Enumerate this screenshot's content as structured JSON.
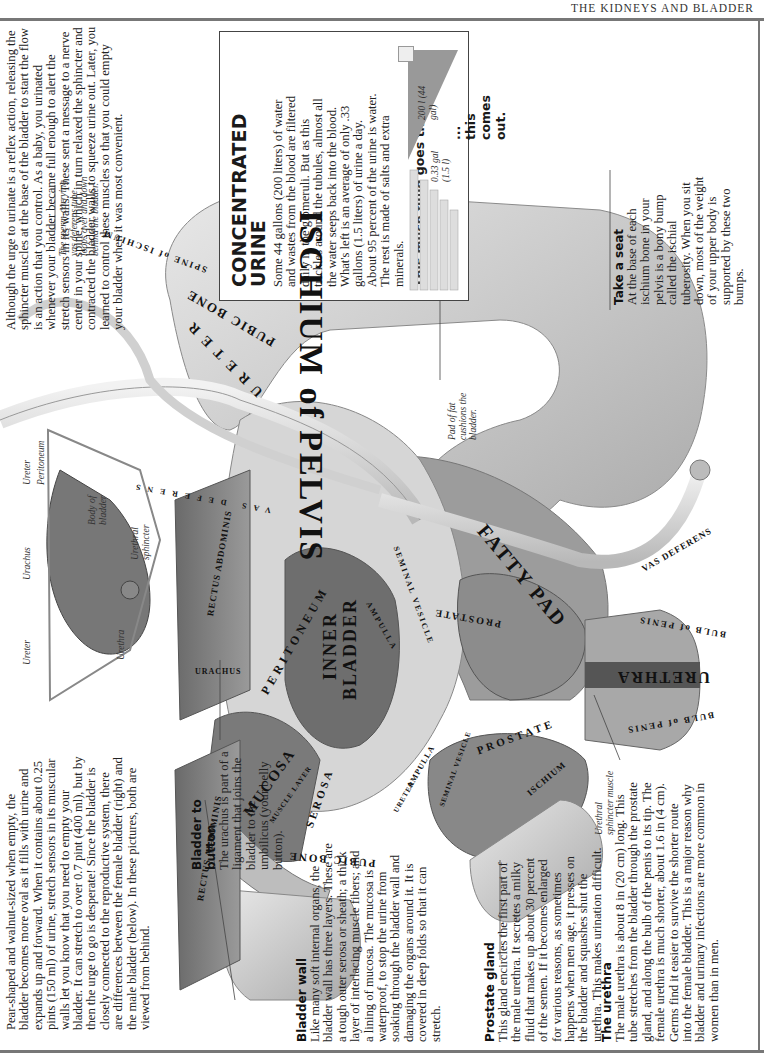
{
  "header": {
    "title": "THE KIDNEYS AND BLADDER"
  },
  "intro": {
    "text": "Pear-shaped and walnut-sized when empty, the bladder becomes more oval as it fills with urine and expands up and forward. When it contains about 0.25 pints (150 ml) of urine, stretch sensors in its muscular walls let you know that you need to empty your bladder. It can stretch to over 0.7 pint (400 ml), but by then the urge to go is desperate! Since the bladder is closely connected to the reproductive system, there are differences between the female bladder (right) and the male bladder (below). In these pictures, both are viewed from behind."
  },
  "reflex": {
    "text": "Although the urge to urinate is a reflex action, releasing the sphincter muscles at the base of the bladder to start the flow is an action that you control. As a baby, you urinated whenever your bladder became full enough to alert the stretch sensors in its walls. These sent a message to a nerve center in your spine, which in turn relaxed the sphincter and contracted the bladder walls to squeeze urine out. Later, you learned to control these muscles so that you could empty your bladder when it was most convenient."
  },
  "concentrated_urine": {
    "title_line1": "CONCENTRATED",
    "title_line2": "URINE",
    "text": "Some 44 gallons (200 liters) of water and wastes from the blood are filtered daily in the glomeruli. But as this trickles around the tubules, almost all the water seeps back into the blood. What's left is an average of only .33 gallons (1.5 liters) of urine a day. About 95 percent of the urine is water. The rest is made of salts and extra minerals.",
    "goes_through": "This much fluid goes through...",
    "comes_out": "... this comes out.",
    "input_volume": "200 l (44 gal)",
    "output_volume_gal": "0.33 gal",
    "output_volume_l": "(1.5 l)"
  },
  "sections": {
    "bladder_button": {
      "heading": "Bladder to button",
      "text": "The urachus is part of a ligament that joins the bladder to the umbilicus (your belly button)."
    },
    "bladder_wall": {
      "heading": "Bladder wall",
      "text": "Like many soft internal organs, the bladder wall has three layers. These are a tough outer serosa or sheath; a thick layer of interlacing muscle fibers; and a lining of mucosa. The mucosa is waterproof, to stop the urine from soaking through the bladder wall and damaging the organs around it. It is covered in deep folds so that it can stretch."
    },
    "prostate_gland": {
      "heading": "Prostate gland",
      "text": "This gland encircles the first part of the male urethra. It secretes a milky fluid that makes up about 30 percent of the semen. If it becomes enlarged for various reasons, as sometimes happens when men age, it presses on the bladder and squashes shut the urethra. This makes urination difficult."
    },
    "urethra": {
      "heading": "The urethra",
      "text": "The male urethra is about 8 in (20 cm) long. This tube stretches from the bladder through the prostate gland, and along the bulb of the penis to its tip. The female urethra is much shorter, about 1.6 in (4 cm). Germs find it easier to survive the shorter route into the female bladder. This is a major reason why bladder and urinary infections are more common in women than in men."
    },
    "take_a_seat": {
      "heading": "Take a seat",
      "text": "At the base of each ischium bone in your pelvis is a bony bump called the ischial tuberosity. When you sit down, most of the weight of your upper body is supported by these two bumps."
    }
  },
  "female_diagram": {
    "labels": [
      "Ureter",
      "Urachus",
      "Ureter",
      "Peritoneum",
      "Body of bladder",
      "Urethral sphincter",
      "Urethra"
    ]
  },
  "captions": {
    "vas_loop": "The sperm-carrying vas deferens tube loops over and down behind the bladder.",
    "fat_pad": "Pad of fat cushions the bladder.",
    "urethral_sphincter_muscle": "Urethral sphincter muscle"
  },
  "anatomy_labels": {
    "ischium_of_pelvis": "ISCHIUM of PELVIS",
    "spine_of_ischium": "SPINE of ISCHIUM",
    "pubic_bone_upper": "PUBIC BONE",
    "ureter_upper": "URETER",
    "vas_deferens_upper": "VAS DEFERENS",
    "rectus_abdominis_upper": "RECTUS ABDOMINIS",
    "peritoneum": "PERITONEUM",
    "urachus": "URACHUS",
    "inner_bladder_1": "INNER",
    "inner_bladder_2": "BLADDER",
    "ampulla_upper": "AMPULLA",
    "seminal_vesicle_upper": "SEMINAL VESICLE",
    "fatty_pad": "FATTY PAD",
    "prostate_upper": "PROSTATE",
    "vas_deferens_right": "VAS DEFERENS",
    "bulb_of_penis_upper": "BULB of PENIS",
    "urethra": "URETHRA",
    "bulb_of_penis_lower": "BULB of PENIS",
    "rectus_abdominis_lower": "RECTUS ABDOMINIS",
    "mucosa": "MUCOSA",
    "muscle_layer": "MUSCLE LAYER",
    "serosa": "SEROSA",
    "pubic_bone_lower": "PUBIC BONE",
    "ureter_lower": "URETER",
    "ampulla_lower": "AMPULLA",
    "seminal_vesicle_lower": "SEMINAL VESICLE",
    "prostate_lower": "PROSTATE",
    "ischium": "ISCHIUM"
  }
}
